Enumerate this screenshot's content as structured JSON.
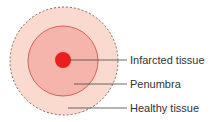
{
  "diagram": {
    "zones": [
      {
        "id": "infarct",
        "label": "Infarcted tissue",
        "color": "#e8211f"
      },
      {
        "id": "penumbra",
        "label": "Penumbra",
        "color": "#f5b5ad"
      },
      {
        "id": "healthy",
        "label": "Healthy tissue",
        "color": "#fad9cf"
      }
    ],
    "colors": {
      "outer_border": "#7a6a66",
      "penumbra_border": "#c9473f",
      "leader_line": "#444444"
    }
  }
}
